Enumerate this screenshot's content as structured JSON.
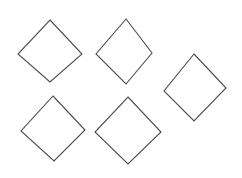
{
  "scene": {
    "title": "Five outlined diamonds",
    "description": "Plain white image containing five unfilled diamond (rotated square) outlines arranged in a loose 2-2-1 grid",
    "background_color": "#ffffff",
    "width": 242,
    "height": 178
  },
  "style": {
    "stroke_color": "#4d4d4d",
    "stroke_width": 1.1,
    "fill": "none"
  },
  "shapes": [
    {
      "id": "diamond-1",
      "label": "Diamond 1 (top left)",
      "kind": "diamond",
      "points": "50,20 82,54 50,82 18,54",
      "center": "50,51",
      "width": 64,
      "height": 62
    },
    {
      "id": "diamond-2",
      "label": "Diamond 2 (top middle)",
      "kind": "diamond",
      "points": "126,19 152,53 126,84 96,54",
      "center": "124,52",
      "width": 56,
      "height": 65
    },
    {
      "id": "diamond-3",
      "label": "Diamond 3 (right)",
      "kind": "diamond",
      "points": "194,54 226,88 194,121 164,91",
      "center": "195,88",
      "width": 62,
      "height": 67
    },
    {
      "id": "diamond-4",
      "label": "Diamond 4 (bottom left)",
      "kind": "diamond",
      "points": "53,96 85,130 54,161 21,131",
      "center": "53,129",
      "width": 64,
      "height": 65
    },
    {
      "id": "diamond-5",
      "label": "Diamond 5 (bottom middle)",
      "kind": "diamond",
      "points": "128,97 161,132 128,164 95,132",
      "center": "128,130",
      "width": 66,
      "height": 67
    }
  ]
}
